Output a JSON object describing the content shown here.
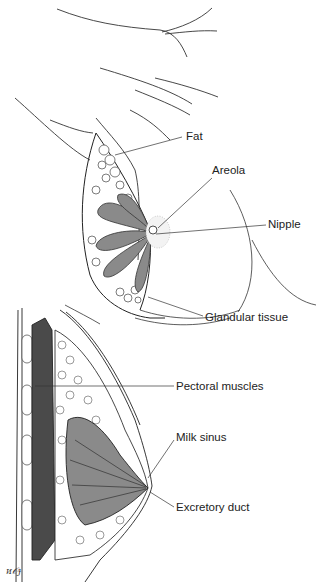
{
  "figure": {
    "upper_view": {
      "labels": [
        {
          "id": "fat",
          "text": "Fat"
        },
        {
          "id": "areola",
          "text": "Areola"
        },
        {
          "id": "nipple",
          "text": "Nipple"
        },
        {
          "id": "glandular",
          "text": "Glandular tissue"
        }
      ]
    },
    "lower_view": {
      "labels": [
        {
          "id": "pectoral",
          "text": "Pectoral muscles"
        },
        {
          "id": "milk_sinus",
          "text": "Milk sinus"
        },
        {
          "id": "excretory",
          "text": "Excretory duct"
        }
      ]
    },
    "signature": "ᴎ𝒪ɟ",
    "colors": {
      "line": "#222222",
      "gland": "#8a8a8a",
      "muscle": "#4a4a4a",
      "leader": "#333333"
    }
  }
}
